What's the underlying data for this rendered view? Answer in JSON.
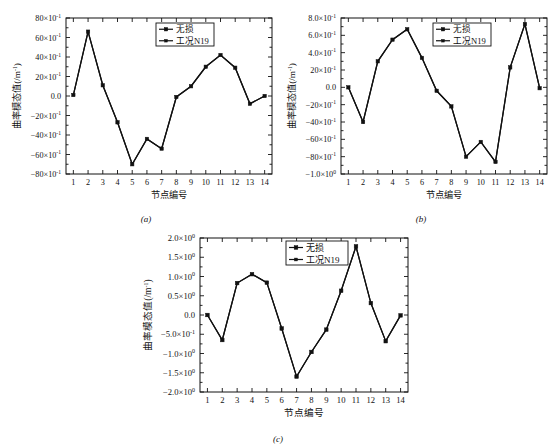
{
  "figure": {
    "panels": [
      {
        "caption": "(a)",
        "xlabel": "节点编号",
        "ylabel": "曲率模态值(/m",
        "ylabel_sup": "-1",
        "ylabel_tail": ")",
        "legend": [
          {
            "label": "无损",
            "marker": "square"
          },
          {
            "label": "工况N19",
            "marker": "square-small"
          }
        ],
        "yticks": [
          {
            "mantissa": "80×10",
            "exp": "-1"
          },
          {
            "mantissa": "60×10",
            "exp": "-1"
          },
          {
            "mantissa": "40×10",
            "exp": "-1"
          },
          {
            "mantissa": "20×10",
            "exp": "-1"
          },
          {
            "mantissa": "0.0",
            "exp": ""
          },
          {
            "mantissa": "−20×10",
            "exp": "-1"
          },
          {
            "mantissa": "−40×10",
            "exp": "-1"
          },
          {
            "mantissa": "−60×10",
            "exp": "-1"
          },
          {
            "mantissa": "−80×10",
            "exp": "-1"
          }
        ],
        "xticks": [
          "1",
          "2",
          "3",
          "4",
          "5",
          "6",
          "7",
          "8",
          "9",
          "10",
          "11",
          "12",
          "13",
          "14"
        ]
      },
      {
        "caption": "(b)",
        "xlabel": "节点编号",
        "ylabel": "曲率模态值(/m",
        "ylabel_sup": "-1",
        "ylabel_tail": ")",
        "legend": [
          {
            "label": "无损",
            "marker": "square"
          },
          {
            "label": "工况N19",
            "marker": "square-small"
          }
        ],
        "yticks": [
          {
            "mantissa": "8.0×10",
            "exp": "-1"
          },
          {
            "mantissa": "6.0×10",
            "exp": "-1"
          },
          {
            "mantissa": "4.0×10",
            "exp": "-1"
          },
          {
            "mantissa": "20×10",
            "exp": "-1"
          },
          {
            "mantissa": "0.0",
            "exp": ""
          },
          {
            "mantissa": "−20×10",
            "exp": "-1"
          },
          {
            "mantissa": "−40×10",
            "exp": "-1"
          },
          {
            "mantissa": "−60×10",
            "exp": "-1"
          },
          {
            "mantissa": "−80×10",
            "exp": "-1"
          },
          {
            "mantissa": "−1.0×10",
            "exp": "0"
          }
        ],
        "xticks": [
          "1",
          "2",
          "3",
          "4",
          "5",
          "6",
          "7",
          "8",
          "9",
          "10",
          "11",
          "12",
          "13",
          "14"
        ]
      },
      {
        "caption": "(c)",
        "xlabel": "节点编号",
        "ylabel": "曲率模态值(/m",
        "ylabel_sup": "-1",
        "ylabel_tail": ")",
        "legend": [
          {
            "label": "无损",
            "marker": "square"
          },
          {
            "label": "工况N19",
            "marker": "square-small"
          }
        ],
        "yticks": [
          {
            "mantissa": "2.0×10",
            "exp": "0"
          },
          {
            "mantissa": "1.5×10",
            "exp": "0"
          },
          {
            "mantissa": "1.0×10",
            "exp": "0"
          },
          {
            "mantissa": "0.5×10",
            "exp": "0"
          },
          {
            "mantissa": "0.0",
            "exp": ""
          },
          {
            "mantissa": "−5.0×10",
            "exp": "-1"
          },
          {
            "mantissa": "−1.0×10",
            "exp": "0"
          },
          {
            "mantissa": "−1.5×10",
            "exp": "0"
          },
          {
            "mantissa": "−2.0×10",
            "exp": "0"
          }
        ],
        "xticks": [
          "1",
          "2",
          "3",
          "4",
          "5",
          "6",
          "7",
          "8",
          "9",
          "10",
          "11",
          "12",
          "13",
          "14"
        ]
      }
    ]
  },
  "chart_data": [
    {
      "type": "line",
      "title": "(a)",
      "xlabel": "节点编号",
      "ylabel": "曲率模态值(/m⁻¹)",
      "x": [
        1,
        2,
        3,
        4,
        5,
        6,
        7,
        8,
        9,
        10,
        11,
        12,
        13,
        14
      ],
      "categories": [
        "1",
        "2",
        "3",
        "4",
        "5",
        "6",
        "7",
        "8",
        "9",
        "10",
        "11",
        "12",
        "13",
        "14"
      ],
      "xlim": [
        0.5,
        14.5
      ],
      "ylim": [
        -8.0,
        8.0
      ],
      "y_scale_note": "values in units of 10^-1 m^-1",
      "yticks": [
        -8.0,
        -6.0,
        -4.0,
        -2.0,
        0.0,
        2.0,
        4.0,
        6.0,
        8.0
      ],
      "grid": false,
      "legend_position": "upper right",
      "series": [
        {
          "name": "无损",
          "values": [
            0.1,
            6.6,
            1.1,
            -2.7,
            -7.0,
            -4.4,
            -5.4,
            -0.1,
            1.0,
            3.0,
            4.2,
            2.9,
            -0.8,
            0.0
          ]
        },
        {
          "name": "工况N19",
          "values": [
            0.1,
            6.6,
            1.1,
            -2.7,
            -7.0,
            -4.4,
            -5.4,
            -0.1,
            1.0,
            3.0,
            4.2,
            2.9,
            -0.8,
            0.0
          ]
        }
      ]
    },
    {
      "type": "line",
      "title": "(b)",
      "xlabel": "节点编号",
      "ylabel": "曲率模态值(/m⁻¹)",
      "x": [
        1,
        2,
        3,
        4,
        5,
        6,
        7,
        8,
        9,
        10,
        11,
        12,
        13,
        14
      ],
      "categories": [
        "1",
        "2",
        "3",
        "4",
        "5",
        "6",
        "7",
        "8",
        "9",
        "10",
        "11",
        "12",
        "13",
        "14"
      ],
      "xlim": [
        0.5,
        14.5
      ],
      "ylim": [
        -10.0,
        8.0
      ],
      "y_scale_note": "values in units of 10^-1 m^-1",
      "yticks": [
        -10.0,
        -8.0,
        -6.0,
        -4.0,
        -2.0,
        0.0,
        2.0,
        4.0,
        6.0,
        8.0
      ],
      "grid": false,
      "legend_position": "upper right",
      "series": [
        {
          "name": "无损",
          "values": [
            0.0,
            -4.0,
            3.0,
            5.5,
            6.7,
            3.4,
            -0.4,
            -2.2,
            -8.0,
            -6.3,
            -8.6,
            2.3,
            7.3,
            -0.1
          ]
        },
        {
          "name": "工况N19",
          "values": [
            0.0,
            -4.0,
            3.0,
            5.5,
            6.7,
            3.4,
            -0.4,
            -2.2,
            -8.0,
            -6.3,
            -8.6,
            2.3,
            7.3,
            -0.1
          ]
        }
      ]
    },
    {
      "type": "line",
      "title": "(c)",
      "xlabel": "节点编号",
      "ylabel": "曲率模态值(/m⁻¹)",
      "x": [
        1,
        2,
        3,
        4,
        5,
        6,
        7,
        8,
        9,
        10,
        11,
        12,
        13,
        14
      ],
      "categories": [
        "1",
        "2",
        "3",
        "4",
        "5",
        "6",
        "7",
        "8",
        "9",
        "10",
        "11",
        "12",
        "13",
        "14"
      ],
      "xlim": [
        0.5,
        14.5
      ],
      "ylim": [
        -2.0,
        2.0
      ],
      "y_scale_note": "values in units of 10^0 m^-1",
      "yticks": [
        -2.0,
        -1.5,
        -1.0,
        -0.5,
        0.0,
        0.5,
        1.0,
        1.5,
        2.0
      ],
      "grid": false,
      "legend_position": "upper center",
      "series": [
        {
          "name": "无损",
          "values": [
            0.0,
            -0.65,
            0.83,
            1.06,
            0.84,
            -0.35,
            -1.6,
            -0.96,
            -0.38,
            0.63,
            1.78,
            0.31,
            -0.68,
            -0.01
          ]
        },
        {
          "name": "工况N19",
          "values": [
            0.0,
            -0.65,
            0.83,
            1.06,
            0.84,
            -0.35,
            -1.6,
            -0.96,
            -0.38,
            0.63,
            1.78,
            0.31,
            -0.68,
            -0.01
          ]
        }
      ]
    }
  ]
}
